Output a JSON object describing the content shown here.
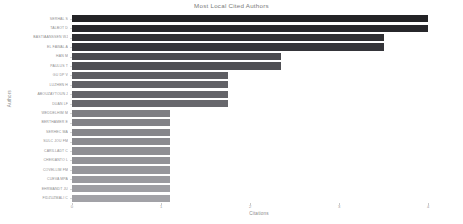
{
  "chart_data": {
    "type": "bar",
    "orientation": "horizontal",
    "title": "Most Local Cited Authors",
    "xlabel": "Citations",
    "ylabel": "Authors",
    "xlim": [
      0,
      4.2
    ],
    "xticks": [
      0,
      1,
      2,
      3,
      4
    ],
    "xticklabels": [
      "0",
      "1",
      "2",
      "3",
      "4"
    ],
    "grid": false,
    "legend": null,
    "categories": [
      "SERHAL  S",
      "TALBOT  D",
      "BASTIAANSSEN  WJ",
      "EL FAWAL  A",
      "HAN  M",
      "PAULUS  T",
      "GU  DP  V",
      "LUZHEN  H",
      "ABOUZAYTOUN  J",
      "DUAN  LF",
      "WEDDELHIM  M",
      "BERTHAMER  E",
      "SERHEC  MA",
      "SULC JOU  FM",
      "CARILLADT  C",
      "CHEKIANTO  L",
      "COVELLIM  FM",
      "CUEVA  MPA",
      "EHRMANDT  JU",
      "FIDZUZMALI  C"
    ],
    "values": [
      4.0,
      4.0,
      3.5,
      3.5,
      2.35,
      2.35,
      1.75,
      1.75,
      1.75,
      1.75,
      1.1,
      1.1,
      1.1,
      1.1,
      1.1,
      1.1,
      1.1,
      1.1,
      1.1,
      1.1
    ],
    "bar_colors": [
      "#232326",
      "#27272b",
      "#2f2f33",
      "#35353a",
      "#4b4b50",
      "#4f4f54",
      "#5e5e63",
      "#616166",
      "#646469",
      "#67676c",
      "#7e7e83",
      "#828287",
      "#86868b",
      "#8a8a8f",
      "#8e8e93",
      "#929297",
      "#96969b",
      "#9a9a9f",
      "#9e9ea3",
      "#a2a2a7"
    ]
  }
}
